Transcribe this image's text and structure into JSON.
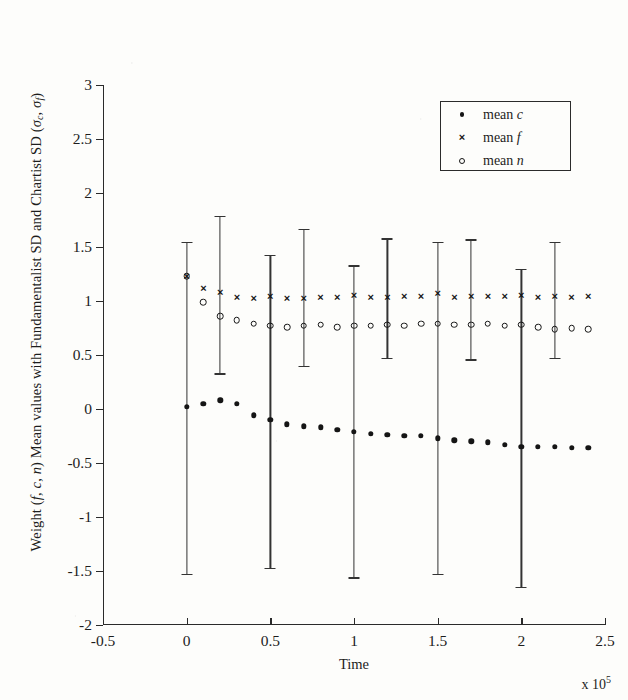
{
  "chart_data": {
    "type": "scatter",
    "title": "",
    "xlabel": "Time",
    "x_exponent_label": "x 10",
    "x_exponent_power": "5",
    "ylabel": "Weight (f, c, n) Mean values with Fundamentalist SD and Chartist SD (σc, σf)",
    "ylabel_parts": {
      "lead": "Weight (",
      "v1": "f",
      "sep1": ", ",
      "v2": "c",
      "sep2": ", ",
      "v3": "n",
      "mid": ") Mean values with Fundamentalist SD and Chartist SD (",
      "s1": "σ",
      "s1sub": "c",
      "sep3": ", ",
      "s2": "σ",
      "s2sub": "f",
      "tail": ")"
    },
    "xlim": [
      -0.5,
      2.5
    ],
    "ylim": [
      -2,
      3
    ],
    "x_ticks": [
      -0.5,
      0,
      0.5,
      1,
      1.5,
      2,
      2.5
    ],
    "x_tick_labels": [
      "-0.5",
      "0",
      "0.5",
      "1",
      "1.5",
      "2",
      "2.5"
    ],
    "y_ticks": [
      -2,
      -1.5,
      -1,
      -0.5,
      0,
      0.5,
      1,
      1.5,
      2,
      2.5,
      3
    ],
    "y_tick_labels": [
      "-2",
      "-1.5",
      "-1",
      "-0.5",
      "0",
      "0.5",
      "1",
      "1.5",
      "2",
      "2.5",
      "3"
    ],
    "grid": false,
    "legend_position": "upper right",
    "legend": [
      {
        "marker": "dot",
        "label_lead": "mean ",
        "label_var": "c"
      },
      {
        "marker": "cross",
        "label_lead": "mean ",
        "label_var": "f"
      },
      {
        "marker": "circle",
        "label_lead": "mean ",
        "label_var": "n"
      }
    ],
    "x": [
      0,
      0.1,
      0.2,
      0.3,
      0.4,
      0.5,
      0.6,
      0.7,
      0.8,
      0.9,
      1.0,
      1.1,
      1.2,
      1.3,
      1.4,
      1.5,
      1.6,
      1.7,
      1.8,
      1.9,
      2.0,
      2.1,
      2.2,
      2.3,
      2.4
    ],
    "series": [
      {
        "name": "mean c",
        "marker": "dot",
        "values": [
          0.02,
          0.05,
          0.08,
          0.05,
          -0.06,
          -0.1,
          -0.14,
          -0.16,
          -0.17,
          -0.19,
          -0.21,
          -0.23,
          -0.24,
          -0.25,
          -0.25,
          -0.27,
          -0.29,
          -0.3,
          -0.31,
          -0.33,
          -0.35,
          -0.35,
          -0.35,
          -0.36,
          -0.36
        ]
      },
      {
        "name": "mean f",
        "marker": "cross",
        "values": [
          1.23,
          1.12,
          1.08,
          1.04,
          1.03,
          1.05,
          1.03,
          1.03,
          1.04,
          1.04,
          1.06,
          1.04,
          1.04,
          1.05,
          1.05,
          1.07,
          1.04,
          1.05,
          1.05,
          1.05,
          1.06,
          1.04,
          1.05,
          1.04,
          1.05
        ]
      },
      {
        "name": "mean n",
        "marker": "circle",
        "values": [
          1.23,
          0.99,
          0.86,
          0.82,
          0.79,
          0.77,
          0.76,
          0.77,
          0.78,
          0.76,
          0.77,
          0.77,
          0.78,
          0.77,
          0.79,
          0.79,
          0.78,
          0.78,
          0.79,
          0.77,
          0.78,
          0.76,
          0.74,
          0.75,
          0.74
        ]
      }
    ],
    "error_bars": [
      {
        "x": 0.0,
        "center": 0.02,
        "upper": 1.55,
        "lower": -1.53
      },
      {
        "x": 0.2,
        "center": 1.08,
        "upper": 1.79,
        "lower": 0.33
      },
      {
        "x": 0.5,
        "center": -0.1,
        "upper": 1.43,
        "lower": -1.47
      },
      {
        "x": 0.7,
        "center": 1.03,
        "upper": 1.67,
        "lower": 0.4
      },
      {
        "x": 1.0,
        "center": -0.21,
        "upper": 1.33,
        "lower": -1.56
      },
      {
        "x": 1.2,
        "center": 1.04,
        "upper": 1.58,
        "lower": 0.47
      },
      {
        "x": 1.5,
        "center": -0.27,
        "upper": 1.55,
        "lower": -1.53
      },
      {
        "x": 1.7,
        "center": 1.05,
        "upper": 1.57,
        "lower": 0.46
      },
      {
        "x": 2.0,
        "center": -0.35,
        "upper": 1.3,
        "lower": -1.65
      },
      {
        "x": 2.2,
        "center": 1.05,
        "upper": 1.55,
        "lower": 0.47
      }
    ]
  }
}
